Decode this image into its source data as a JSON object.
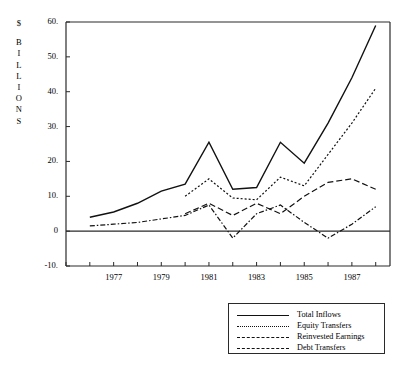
{
  "figure": {
    "axis_title_lines": [
      "$",
      "B",
      "I",
      "L",
      "L",
      "I",
      "O",
      "N",
      "S"
    ],
    "axis_title_text": "$ BILLIONS",
    "line_color": "#111111",
    "axis_color": "#2a2a2a",
    "background": "#ffffff"
  },
  "legend": {
    "entries": [
      {
        "label": "Total Inflows",
        "style": "solid"
      },
      {
        "label": "Equity Transfers",
        "style": "dotted"
      },
      {
        "label": "Reinvested Earnings",
        "style": "dash-dot"
      },
      {
        "label": "Debt Transfers",
        "style": "dashed"
      }
    ]
  },
  "chart_data": {
    "type": "line",
    "title": "",
    "xlabel": "",
    "ylabel": "$ BILLIONS",
    "xlim": [
      1975,
      1988.6
    ],
    "ylim": [
      -10,
      60
    ],
    "yticks": [
      -10,
      0,
      10,
      20,
      30,
      40,
      50,
      60
    ],
    "ytick_labels": [
      "-10.",
      "0",
      "10.",
      "20.",
      "30.",
      "40.",
      "50.",
      "60."
    ],
    "xticks": [
      1975,
      1976,
      1977,
      1978,
      1979,
      1980,
      1981,
      1982,
      1983,
      1984,
      1985,
      1986,
      1987,
      1988
    ],
    "xtick_labels": [
      "1977",
      "1979",
      "1981",
      "1983",
      "1985",
      "1987"
    ],
    "xtick_labeled_years": [
      1977,
      1979,
      1981,
      1983,
      1985,
      1987
    ],
    "grid": false,
    "legend_position": "below-center",
    "zero_line": true,
    "series": [
      {
        "name": "Total Inflows",
        "style": "solid",
        "x": [
          1976,
          1977,
          1978,
          1979,
          1980,
          1981,
          1982,
          1983,
          1984,
          1985,
          1986,
          1987,
          1988
        ],
        "values": [
          4.0,
          5.5,
          8.0,
          11.5,
          13.5,
          25.5,
          12.0,
          12.5,
          25.5,
          19.5,
          31.0,
          44.0,
          59.0
        ]
      },
      {
        "name": "Equity Transfers",
        "style": "dotted",
        "x": [
          1980,
          1981,
          1982,
          1983,
          1984,
          1985,
          1986,
          1987,
          1988
        ],
        "values": [
          10.0,
          15.0,
          9.5,
          9.0,
          15.5,
          13.0,
          22.0,
          31.0,
          41.0
        ]
      },
      {
        "name": "Reinvested Earnings",
        "style": "dash-dot",
        "x": [
          1976,
          1977,
          1978,
          1979,
          1980,
          1981,
          1982,
          1983,
          1984,
          1985,
          1986,
          1987,
          1988
        ],
        "values": [
          1.5,
          2.0,
          2.5,
          3.5,
          4.5,
          7.5,
          -2.0,
          5.0,
          7.5,
          2.5,
          -2.0,
          2.0,
          7.0
        ]
      },
      {
        "name": "Debt Transfers",
        "style": "dashed",
        "x": [
          1980,
          1981,
          1982,
          1983,
          1984,
          1985,
          1986,
          1987,
          1988
        ],
        "values": [
          5.0,
          8.0,
          4.5,
          8.0,
          5.0,
          10.0,
          14.0,
          15.0,
          12.0
        ]
      }
    ]
  }
}
